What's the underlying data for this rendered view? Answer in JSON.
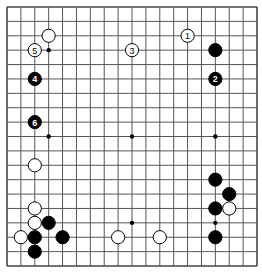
{
  "board": {
    "size": 19,
    "origin_x": 7,
    "origin_y": 7,
    "spacing_x": 13.89,
    "spacing_y": 14.39,
    "stone_radius": 6.6,
    "line_color": "#555555",
    "background": "#ffffff",
    "hoshi": [
      [
        3,
        3
      ],
      [
        9,
        3
      ],
      [
        15,
        3
      ],
      [
        3,
        9
      ],
      [
        9,
        9
      ],
      [
        15,
        9
      ],
      [
        3,
        15
      ],
      [
        9,
        15
      ],
      [
        15,
        15
      ]
    ],
    "stones": [
      {
        "col": 3,
        "row": 2,
        "color": "white",
        "label": ""
      },
      {
        "col": 2,
        "row": 3,
        "color": "white",
        "label": "5"
      },
      {
        "col": 2,
        "row": 5,
        "color": "black",
        "label": "4"
      },
      {
        "col": 2,
        "row": 8,
        "color": "black",
        "label": "6"
      },
      {
        "col": 9,
        "row": 3,
        "color": "white",
        "label": "3"
      },
      {
        "col": 13,
        "row": 2,
        "color": "white",
        "label": "1"
      },
      {
        "col": 15,
        "row": 3,
        "color": "black",
        "label": ""
      },
      {
        "col": 15,
        "row": 5,
        "color": "black",
        "label": "2"
      },
      {
        "col": 2,
        "row": 11,
        "color": "white",
        "label": ""
      },
      {
        "col": 2,
        "row": 14,
        "color": "white",
        "label": ""
      },
      {
        "col": 2,
        "row": 15,
        "color": "white",
        "label": ""
      },
      {
        "col": 3,
        "row": 15,
        "color": "black",
        "label": ""
      },
      {
        "col": 1,
        "row": 16,
        "color": "white",
        "label": ""
      },
      {
        "col": 2,
        "row": 16,
        "color": "black",
        "label": ""
      },
      {
        "col": 4,
        "row": 16,
        "color": "black",
        "label": ""
      },
      {
        "col": 2,
        "row": 17,
        "color": "black",
        "label": ""
      },
      {
        "col": 8,
        "row": 16,
        "color": "white",
        "label": ""
      },
      {
        "col": 11,
        "row": 16,
        "color": "white",
        "label": ""
      },
      {
        "col": 15,
        "row": 12,
        "color": "black",
        "label": ""
      },
      {
        "col": 16,
        "row": 13,
        "color": "black",
        "label": ""
      },
      {
        "col": 15,
        "row": 14,
        "color": "black",
        "label": ""
      },
      {
        "col": 16,
        "row": 14,
        "color": "white",
        "label": ""
      },
      {
        "col": 15,
        "row": 16,
        "color": "black",
        "label": ""
      }
    ]
  }
}
